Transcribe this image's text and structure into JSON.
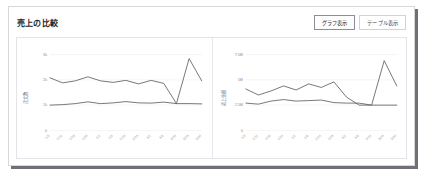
{
  "card": {
    "title": "売上の比較"
  },
  "toolbar": {
    "buttons": [
      {
        "label": "グラフ表示",
        "active": true
      },
      {
        "label": "テーブル表示",
        "active": false
      }
    ]
  },
  "chart_data": [
    {
      "type": "line",
      "title": "",
      "xlabel": "",
      "ylabel": "注文数",
      "ylim": [
        0,
        3200
      ],
      "yticks": [
        0,
        1000,
        2000,
        3000
      ],
      "ytick_labels": [
        "0",
        "1k",
        "2k",
        "3k"
      ],
      "grid": true,
      "legend": "none",
      "x": [
        "1/5",
        "1/12",
        "1/19",
        "1/26",
        "2/2",
        "2/9",
        "2/16",
        "2/23",
        "3/2",
        "3/9",
        "3/16",
        "3/23",
        "3/30"
      ],
      "series": [
        {
          "name": "今期",
          "values": [
            1000,
            1020,
            1060,
            1130,
            1060,
            1090,
            1140,
            1090,
            1080,
            1120,
            1060,
            1060,
            1050
          ]
        },
        {
          "name": "前期",
          "values": [
            2080,
            1880,
            1960,
            2120,
            1960,
            1900,
            1980,
            1840,
            1980,
            1860,
            1060,
            2840,
            1960
          ]
        }
      ]
    },
    {
      "type": "line",
      "title": "",
      "xlabel": "",
      "ylabel": "売上金額",
      "ylim": [
        0,
        8000000
      ],
      "yticks": [
        0,
        2500000,
        5000000,
        7500000
      ],
      "ytick_labels": [
        "0",
        "2.5M",
        "5M",
        "7.5M"
      ],
      "grid": true,
      "legend": "none",
      "x": [
        "1/5",
        "1/12",
        "1/19",
        "1/26",
        "2/2",
        "2/9",
        "2/16",
        "2/23",
        "3/2",
        "3/9",
        "3/16",
        "3/23",
        "3/30"
      ],
      "series": [
        {
          "name": "今期",
          "values": [
            2700000,
            2600000,
            2900000,
            3050000,
            2900000,
            2950000,
            3000000,
            2750000,
            2700000,
            2700000,
            2500000,
            6900000,
            4400000
          ]
        },
        {
          "name": "前期",
          "values": [
            4100000,
            3500000,
            3900000,
            4400000,
            4000000,
            4600000,
            4250000,
            4800000,
            3300000,
            2500000,
            2500000,
            2500000,
            2500000
          ]
        }
      ]
    }
  ],
  "colors": {
    "line": "#55555c",
    "grid": "#ededf0",
    "border": "#d8d8dc",
    "shadow": "#6f6f76",
    "text": "#24242a",
    "muted": "#8a8a92"
  }
}
